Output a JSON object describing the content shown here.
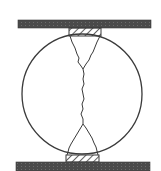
{
  "diagram": {
    "colors": {
      "background": "#ffffff",
      "plate_fill": "#4a4a4a",
      "outline": "#3a3a3a",
      "hatch": "#3a3a3a"
    },
    "components": [
      {
        "id": "top-plate",
        "label": "Top loading plate"
      },
      {
        "id": "top-bearing-strip",
        "label": "Top bearing strip (hatched)"
      },
      {
        "id": "specimen",
        "label": "Cylindrical specimen (circular cross-section)"
      },
      {
        "id": "crack",
        "label": "Diametral splitting crack"
      },
      {
        "id": "bottom-bearing-strip",
        "label": "Bottom bearing strip (hatched)"
      },
      {
        "id": "bottom-plate",
        "label": "Bottom loading plate"
      }
    ]
  }
}
